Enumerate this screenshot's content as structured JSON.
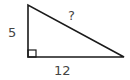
{
  "diagram": {
    "type": "right-triangle",
    "labels": {
      "vertical_leg": "5",
      "horizontal_leg": "12",
      "hypotenuse": "?"
    },
    "right_angle_marker": true,
    "colors": {
      "stroke": "#1a1a1a",
      "label": "#444444",
      "background": "#ffffff"
    }
  }
}
